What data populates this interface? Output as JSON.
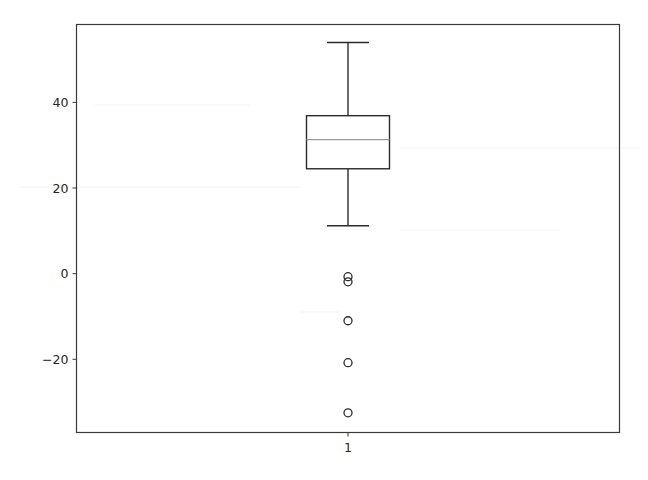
{
  "chart_data": {
    "type": "box",
    "title": "",
    "xlabel": "",
    "ylabel": "",
    "categories": [
      "1"
    ],
    "series": [
      {
        "name": "1",
        "whisker_low": 11.2,
        "q1": 24.5,
        "median": 31.3,
        "q3": 36.9,
        "whisker_high": 54.0,
        "fliers": [
          -0.7,
          -1.9,
          -11.0,
          -20.8,
          -32.5
        ]
      }
    ],
    "yticks": [
      -20,
      0,
      20,
      40
    ],
    "ytick_labels": [
      "−20",
      "0",
      "20",
      "40"
    ],
    "xticks": [
      1
    ],
    "xtick_labels": [
      "1"
    ],
    "ylim": [
      -37.1,
      58.2
    ],
    "xlim": [
      0.5,
      1.5
    ],
    "grid": false,
    "legend": null
  },
  "colors": {
    "axes": "#3a3a3a",
    "box": "#2b2b2b",
    "median": "#9a9a9a",
    "flier": "#2b2b2b",
    "text": "#262626"
  }
}
